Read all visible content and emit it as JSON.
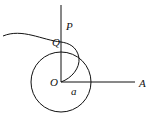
{
  "diagram": {
    "labels": {
      "P": "P",
      "Q": "Q",
      "O": "O",
      "A": "A",
      "a": "a"
    },
    "colors": {
      "stroke": "#111111",
      "background": "#ffffff"
    }
  }
}
